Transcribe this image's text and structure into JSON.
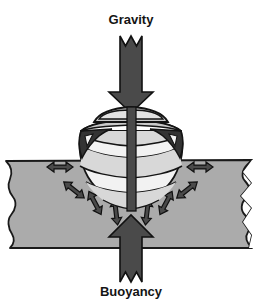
{
  "figure": {
    "kind": "physics-force-diagram",
    "background_color": "#ffffff",
    "width": 261,
    "height": 308
  },
  "labels": {
    "top": "Gravity",
    "bottom": "Buoyancy"
  },
  "colors": {
    "background": "#ffffff",
    "water_fill": "#ababab",
    "water_outline": "#1a1a1a",
    "arrow_dark": "#4a4a4a",
    "arrow_outline": "#111111",
    "hull_light": "#f2f2f2",
    "hull_mid": "#d8d8d8",
    "hull_shadow": "#b9b9b9",
    "hull_dark": "#333333",
    "deck_gray": "#c9c9c9",
    "outline": "#141414",
    "text": "#141414"
  },
  "forces": {
    "gravity": {
      "label": "Gravity",
      "direction": "down",
      "style": "thick-block-arrow-with-notched-tail",
      "tip_x": 131,
      "tip_y": 112,
      "tail_y": 36
    },
    "buoyancy": {
      "label": "Buoyancy",
      "direction": "up",
      "style": "thick-block-arrow-with-notched-tail",
      "tip_x": 131,
      "tip_y": 215,
      "tail_y": 282
    },
    "pressure_arrows": {
      "count": 8,
      "style": "double-headed",
      "description": "water pressure acting perpendicular to the hull, radiating outward on both sides",
      "items": [
        {
          "id": "left-1",
          "angle_deg": 180,
          "cx": 60,
          "cy": 167,
          "length": 26
        },
        {
          "id": "left-2",
          "angle_deg": 218,
          "cx": 74,
          "cy": 190,
          "length": 26
        },
        {
          "id": "left-3",
          "angle_deg": 240,
          "cx": 94,
          "cy": 203,
          "length": 26
        },
        {
          "id": "left-4",
          "angle_deg": 262,
          "cx": 116,
          "cy": 212,
          "length": 26
        },
        {
          "id": "right-1",
          "angle_deg": 0,
          "cx": 199,
          "cy": 167,
          "length": 26
        },
        {
          "id": "right-2",
          "angle_deg": 322,
          "cx": 186,
          "cy": 190,
          "length": 26
        },
        {
          "id": "right-3",
          "angle_deg": 300,
          "cx": 166,
          "cy": 203,
          "length": 26
        },
        {
          "id": "right-4",
          "angle_deg": 278,
          "cx": 147,
          "cy": 212,
          "length": 26
        }
      ]
    }
  },
  "water": {
    "name": "water-body",
    "top_y": 158,
    "bottom_y": 248,
    "left_edge": "wavy-torn",
    "right_edge": "jagged-torn"
  },
  "boat": {
    "name": "boat-bow-view",
    "parts": [
      "cabin-windshield",
      "deck",
      "dark-bow-flare-left",
      "dark-bow-flare-right",
      "hawse-hole-left",
      "hawse-hole-right",
      "hull-planking",
      "stem-post"
    ],
    "planking_lines": 5,
    "waterline_y": 158
  }
}
